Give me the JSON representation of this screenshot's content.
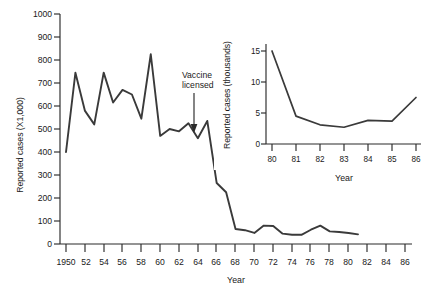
{
  "chart_data": [
    {
      "id": "main",
      "type": "line",
      "title": "",
      "xlabel": "Year",
      "ylabel": "Reported cases (X1,000)",
      "xlim": [
        1950,
        1987
      ],
      "ylim": [
        0,
        1000
      ],
      "grid": false,
      "legend": "none",
      "xtick_labels": [
        "1950",
        "52",
        "54",
        "56",
        "58",
        "60",
        "62",
        "64",
        "66",
        "68",
        "70",
        "72",
        "74",
        "76",
        "78",
        "80",
        "82",
        "84",
        "86"
      ],
      "xtick_values": [
        1950,
        1952,
        1954,
        1956,
        1958,
        1960,
        1962,
        1964,
        1966,
        1968,
        1970,
        1972,
        1974,
        1976,
        1978,
        1980,
        1982,
        1984,
        1986
      ],
      "ytick_labels": [
        "0",
        "100",
        "200",
        "300",
        "400",
        "500",
        "600",
        "700",
        "800",
        "900",
        "1000"
      ],
      "ytick_values": [
        0,
        100,
        200,
        300,
        400,
        500,
        600,
        700,
        800,
        900,
        1000
      ],
      "series": [
        {
          "name": "Measles reported cases (thousands)",
          "x": [
            1950,
            1951,
            1952,
            1953,
            1954,
            1955,
            1956,
            1957,
            1958,
            1959,
            1960,
            1961,
            1962,
            1963,
            1964,
            1965,
            1966,
            1967,
            1968,
            1969,
            1970,
            1971,
            1972,
            1973,
            1974,
            1975,
            1976,
            1977,
            1978,
            1979,
            1980,
            1981
          ],
          "values": [
            400,
            745,
            580,
            520,
            745,
            615,
            670,
            650,
            545,
            825,
            470,
            500,
            490,
            525,
            460,
            535,
            265,
            225,
            65,
            60,
            48,
            80,
            78,
            45,
            40,
            40,
            62,
            80,
            55,
            52,
            48,
            42
          ]
        }
      ],
      "annotations": [
        {
          "text": "Vaccine\nlicensed",
          "lines": [
            "Vaccine",
            "licensed"
          ],
          "x": 1963,
          "y": 505,
          "arrow": true
        }
      ]
    },
    {
      "id": "inset",
      "type": "line",
      "title": "",
      "xlabel": "Year",
      "ylabel": "Reported cases (thousands)",
      "xlim": [
        1980,
        1986
      ],
      "ylim": [
        0,
        16
      ],
      "grid": false,
      "legend": "none",
      "xtick_labels": [
        "80",
        "81",
        "82",
        "83",
        "84",
        "85",
        "86"
      ],
      "xtick_values": [
        1980,
        1981,
        1982,
        1983,
        1984,
        1985,
        1986
      ],
      "ytick_labels": [
        "0",
        "5",
        "10",
        "15"
      ],
      "ytick_values": [
        0,
        5,
        10,
        15
      ],
      "series": [
        {
          "name": "Measles reported cases (thousands)",
          "x": [
            1980,
            1981,
            1982,
            1983,
            1984,
            1985,
            1986
          ],
          "values": [
            15.0,
            4.5,
            3.1,
            2.7,
            3.8,
            3.7,
            7.5
          ]
        }
      ],
      "annotations": []
    }
  ],
  "figure": {
    "main_ylabel": "Reported cases (X1,000)",
    "main_xlabel": "Year",
    "inset_ylabel": "Reported cases (thousands)",
    "inset_xlabel": "Year",
    "annotation_line1": "Vaccine",
    "annotation_line2": "licensed",
    "ytick_0": "0",
    "ytick_100": "100",
    "ytick_200": "200",
    "ytick_300": "300",
    "ytick_400": "400",
    "ytick_500": "500",
    "ytick_600": "600",
    "ytick_700": "700",
    "ytick_800": "800",
    "ytick_900": "900",
    "ytick_1000": "1000",
    "xtick_1950": "1950",
    "xtick_52": "52",
    "xtick_54": "54",
    "xtick_56": "56",
    "xtick_58": "58",
    "xtick_60": "60",
    "xtick_62": "62",
    "xtick_64": "64",
    "xtick_66": "66",
    "xtick_68": "68",
    "xtick_70": "70",
    "xtick_72": "72",
    "xtick_74": "74",
    "xtick_76": "76",
    "xtick_78": "78",
    "xtick_80": "80",
    "xtick_82": "82",
    "xtick_84": "84",
    "xtick_86": "86",
    "inset_ytick_0": "0",
    "inset_ytick_5": "5",
    "inset_ytick_10": "10",
    "inset_ytick_15": "15",
    "inset_xtick_80": "80",
    "inset_xtick_81": "81",
    "inset_xtick_82": "82",
    "inset_xtick_83": "83",
    "inset_xtick_84": "84",
    "inset_xtick_85": "85",
    "inset_xtick_86": "86",
    "line_color": "#3a3a3a",
    "axis_color": "#2b2b2b",
    "background_color": "#ffffff"
  }
}
